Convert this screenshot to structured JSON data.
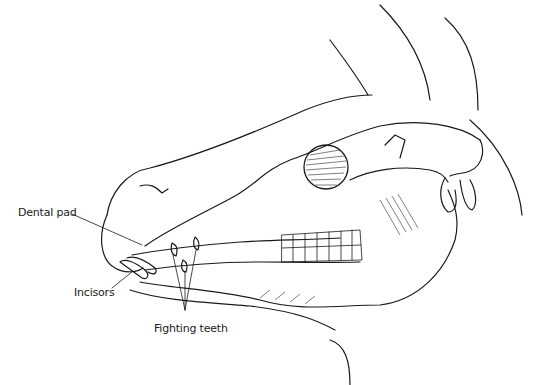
{
  "figure": {
    "labels": [
      {
        "id": "dental-pad",
        "text": "Dental pad"
      },
      {
        "id": "incisors",
        "text": "Incisors"
      },
      {
        "id": "fighting-teeth",
        "text": "Fighting teeth"
      }
    ]
  },
  "colors": {
    "line": "#1a1a1a",
    "background": "#ffffff"
  }
}
